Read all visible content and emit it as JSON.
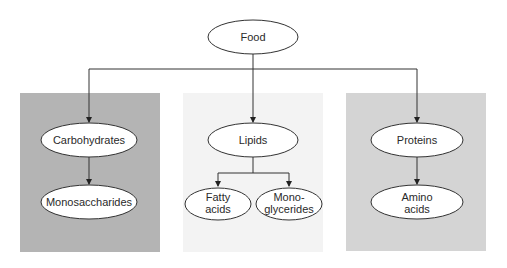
{
  "diagram": {
    "root": {
      "label": "Food"
    },
    "panels": [
      {
        "name": "carbohydrates-panel",
        "color": "#b4b4b4"
      },
      {
        "name": "lipids-panel",
        "color": "#f3f3f3"
      },
      {
        "name": "proteins-panel",
        "color": "#d4d4d4"
      }
    ],
    "nodes": {
      "carbohydrates": "Carbohydrates",
      "monosaccharides": "Monosaccharides",
      "lipids": "Lipids",
      "fatty_acids_1": "Fatty",
      "fatty_acids_2": "acids",
      "monoglycerides_1": "Mono-",
      "monoglycerides_2": "glycerides",
      "proteins": "Proteins",
      "amino_acids_1": "Amino",
      "amino_acids_2": "acids"
    },
    "edges": [
      [
        "Food",
        "Carbohydrates"
      ],
      [
        "Food",
        "Lipids"
      ],
      [
        "Food",
        "Proteins"
      ],
      [
        "Carbohydrates",
        "Monosaccharides"
      ],
      [
        "Lipids",
        "Fatty acids"
      ],
      [
        "Lipids",
        "Monoglycerides"
      ],
      [
        "Proteins",
        "Amino acids"
      ]
    ]
  }
}
